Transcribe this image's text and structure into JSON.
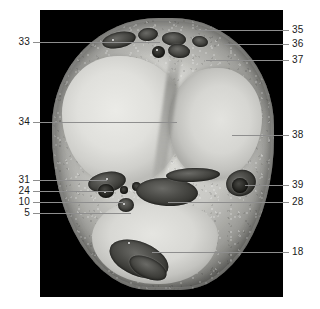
{
  "figure": {
    "type": "anatomical-cross-section-photograph",
    "plate_background": "#000000",
    "page_background": "#ffffff",
    "specimen_description": "Transverse anatomical section, grayscale photographic plate with numbered leader-line labels"
  },
  "labels": {
    "left": [
      {
        "id": "label-33",
        "text": "33",
        "y": 42,
        "line_end_x": 120
      },
      {
        "id": "label-34",
        "text": "34",
        "y": 122,
        "line_end_x": 137
      },
      {
        "id": "label-31",
        "text": "31",
        "y": 180,
        "line_end_x": 104
      },
      {
        "id": "label-24",
        "text": "24",
        "y": 191,
        "line_end_x": 113
      },
      {
        "id": "label-10",
        "text": "10",
        "y": 202,
        "line_end_x": 123
      },
      {
        "id": "label-5",
        "text": "5",
        "y": 213,
        "line_end_x": 131
      }
    ],
    "right": [
      {
        "id": "label-35",
        "text": "35",
        "y": 30,
        "line_start_x": 158
      },
      {
        "id": "label-36",
        "text": "36",
        "y": 44,
        "line_start_x": 184
      },
      {
        "id": "label-37",
        "text": "37",
        "y": 60,
        "line_start_x": 166
      },
      {
        "id": "label-38",
        "text": "38",
        "y": 135,
        "line_start_x": 232
      },
      {
        "id": "label-39",
        "text": "39",
        "y": 185,
        "line_start_x": 245
      },
      {
        "id": "label-28",
        "text": "28",
        "y": 202,
        "line_start_x": 168
      },
      {
        "id": "label-18",
        "text": "18",
        "y": 252,
        "line_start_x": 152
      }
    ]
  },
  "legend_note": {
    "numbering_scheme": "numeric keys referencing an external structure list",
    "visible_numbers": [
      5,
      10,
      18,
      24,
      28,
      31,
      33,
      34,
      35,
      36,
      37,
      38,
      39
    ]
  },
  "colors": {
    "plate": "#000000",
    "leader_line": "#8e8e8e",
    "label_text": "#1a1a1a",
    "tissue_light": "#e5e5e1",
    "tissue_mid": "#c6c6c2",
    "tissue_dark": "#4d4d49"
  }
}
